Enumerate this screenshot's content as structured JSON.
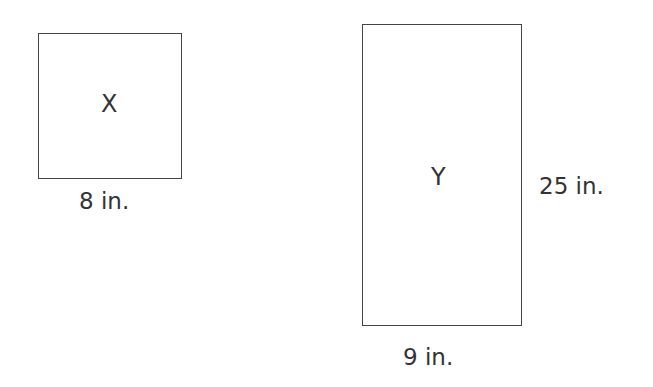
{
  "shapes": {
    "x": {
      "name": "X",
      "type": "square",
      "bottom_label": "8 in."
    },
    "y": {
      "name": "Y",
      "type": "rectangle",
      "bottom_label": "9 in.",
      "side_label": "25 in."
    }
  },
  "colors": {
    "stroke": "#444444",
    "text": "#333333",
    "background": "#ffffff"
  }
}
